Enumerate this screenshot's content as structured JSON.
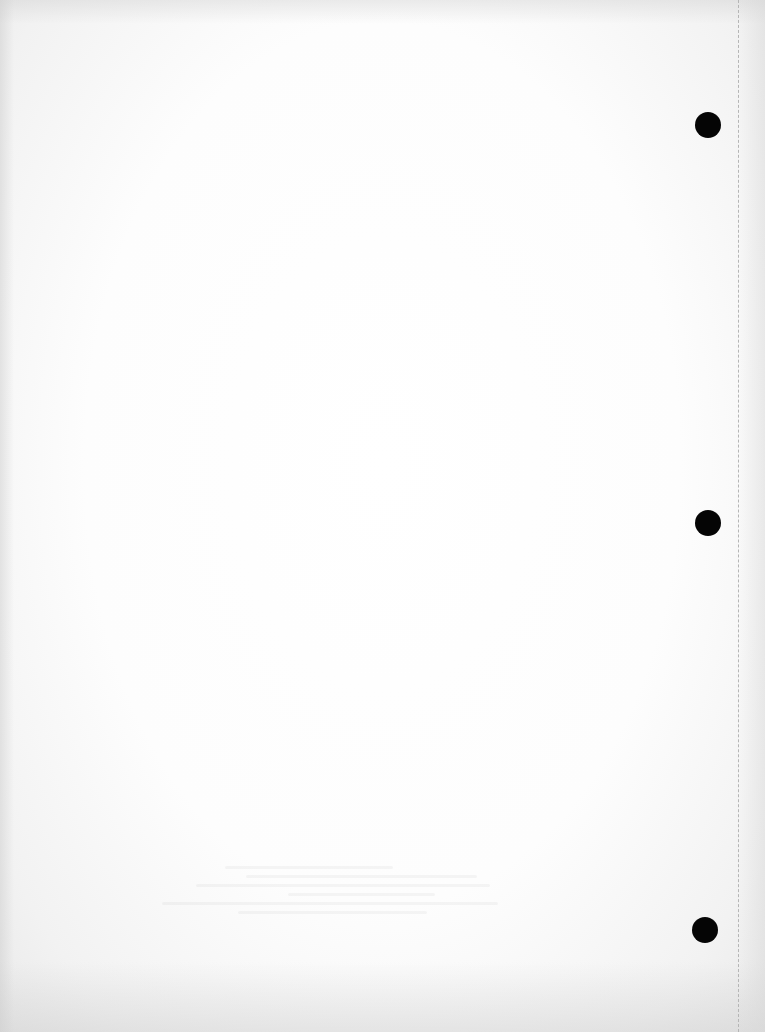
{
  "document": {
    "type": "blank loose-leaf sheet",
    "text_content": "",
    "punch_holes": [
      {
        "x": 708,
        "y": 125
      },
      {
        "x": 708,
        "y": 523
      },
      {
        "x": 705,
        "y": 930
      }
    ],
    "colors": {
      "paper": "#ffffff",
      "hole": "#050505",
      "perforation": "#b5b5b5"
    }
  }
}
